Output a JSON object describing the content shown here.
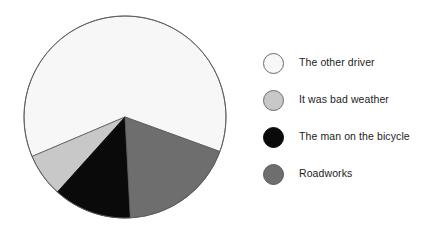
{
  "chart_data": {
    "type": "pie",
    "title": "",
    "subtitle": "",
    "xlabel": "",
    "ylabel": "",
    "grid": false,
    "legend_position": "right",
    "start_angle_deg_cw_from_top": 110,
    "direction": "counterclockwise",
    "center": {
      "x": 125,
      "y": 117
    },
    "radius": 101,
    "labels": [
      "The other driver",
      "It was bad weather",
      "The man on the bicycle",
      "Roadworks"
    ],
    "values": [
      62,
      7,
      12.5,
      18.5
    ],
    "slices": [
      {
        "label": "The other driver",
        "value": 62,
        "angle_deg": 223,
        "color": "#f7f7f7",
        "stroke": "#5a5a5a",
        "legend_swatch": "white-circle-icon"
      },
      {
        "label": "It was bad weather",
        "value": 7,
        "angle_deg": 25,
        "color": "#c8c8c8",
        "stroke": "#5a5a5a",
        "legend_swatch": "light-gray-circle-icon"
      },
      {
        "label": "The man on the bicycle",
        "value": 12.5,
        "angle_deg": 45,
        "color": "#0a0a0a",
        "stroke": "#0a0a0a",
        "legend_swatch": "black-circle-icon"
      },
      {
        "label": "Roadworks",
        "value": 18.5,
        "angle_deg": 67,
        "color": "#6e6e6e",
        "stroke": "#5a5a5a",
        "legend_swatch": "dark-gray-circle-icon"
      }
    ]
  },
  "legend": {
    "items": [
      {
        "label": "The other driver",
        "color": "#f7f7f7",
        "border": "#6b6b6b"
      },
      {
        "label": "It was bad weather",
        "color": "#c8c8c8",
        "border": "#6b6b6b"
      },
      {
        "label": "The man on the bicycle",
        "color": "#0a0a0a",
        "border": "#0a0a0a"
      },
      {
        "label": "Roadworks",
        "color": "#6e6e6e",
        "border": "#5a5a5a"
      }
    ]
  },
  "colors": {
    "background": "#ffffff",
    "outline": "#5a5a5a",
    "text": "#1c1c1c"
  }
}
